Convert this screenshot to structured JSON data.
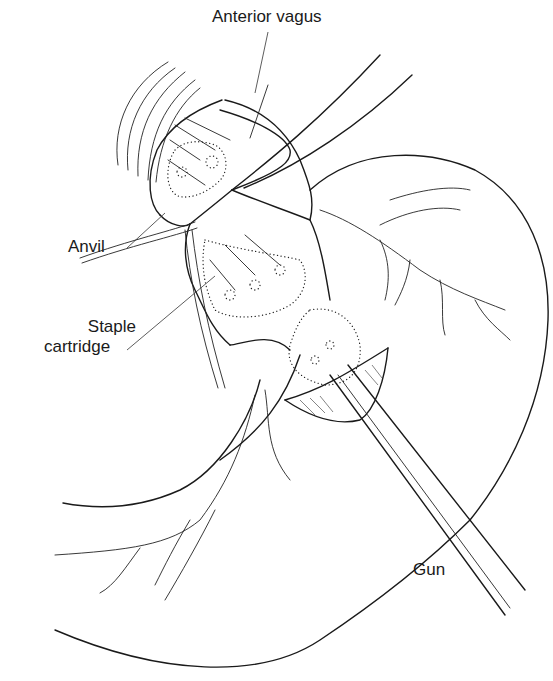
{
  "figure": {
    "labels": {
      "anterior_vagus": "Anterior vagus",
      "anvil": "Anvil",
      "staple_cartridge_line1": "Staple",
      "staple_cartridge_line2": "cartridge",
      "gun": "Gun"
    },
    "colors": {
      "line": "#1a1a1a",
      "background": "#ffffff"
    }
  }
}
